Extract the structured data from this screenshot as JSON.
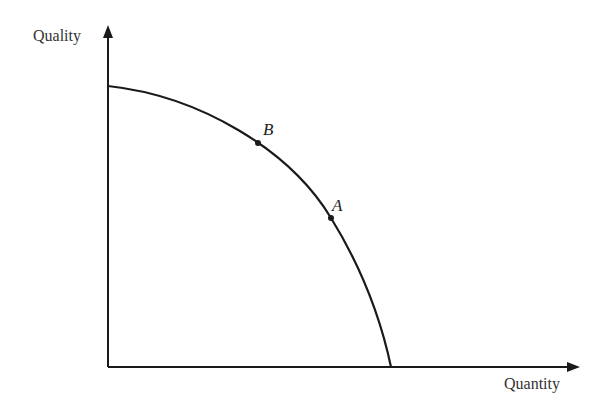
{
  "diagram": {
    "type": "production-possibility-frontier",
    "axes": {
      "y_label": "Quality",
      "x_label": "Quantity"
    },
    "points": [
      {
        "label": "B",
        "x": 258,
        "y": 143
      },
      {
        "label": "A",
        "x": 331,
        "y": 218
      }
    ],
    "curve": {
      "start": [
        108,
        86
      ],
      "end": [
        391,
        367
      ]
    },
    "colors": {
      "line": "#1a1a1a",
      "text": "#333333"
    }
  }
}
